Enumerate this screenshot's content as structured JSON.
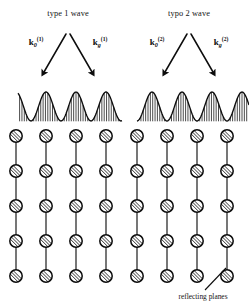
{
  "figure": {
    "name": "bloch-wave-diffraction-diagram",
    "background": "#ffffff",
    "ink_color": "#0d0d0d",
    "width": 249,
    "height": 306
  },
  "panels": [
    {
      "id": "type-1",
      "title": "type 1 wave",
      "title_x": 68,
      "title_y": 16,
      "apex": {
        "x": 68,
        "y": 34
      },
      "vectors": [
        {
          "id": "k0-1",
          "symbol": "k",
          "subscript": "0",
          "superscript": "(1)",
          "label_x": 36,
          "label_y": 45,
          "arrow_from": {
            "x": 66,
            "y": 34
          },
          "arrow_to": {
            "x": 44,
            "y": 72
          }
        },
        {
          "id": "kg-1",
          "symbol": "k",
          "subscript": "g",
          "superscript": "(1)",
          "label_x": 100,
          "label_y": 45,
          "arrow_from": {
            "x": 70,
            "y": 34
          },
          "arrow_to": {
            "x": 92,
            "y": 72
          }
        }
      ],
      "wave": {
        "description": "standing wave with maxima centered on the atom planes",
        "peaks_on_atoms": true,
        "peak_count": 3,
        "peak_positions": [
          46,
          76,
          106
        ],
        "baseline_y": 121,
        "peak_y": 92,
        "x_start": 18,
        "x_end": 122
      }
    },
    {
      "id": "type-2",
      "title": "typo 2 wave",
      "title_x": 189,
      "title_y": 16,
      "apex": {
        "x": 189,
        "y": 34
      },
      "vectors": [
        {
          "id": "k0-2",
          "symbol": "k",
          "subscript": "0",
          "superscript": "(2)",
          "label_x": 157,
          "label_y": 45,
          "arrow_from": {
            "x": 187,
            "y": 34
          },
          "arrow_to": {
            "x": 165,
            "y": 72
          }
        },
        {
          "id": "kg-2",
          "symbol": "k",
          "subscript": "g",
          "superscript": "(2)",
          "label_x": 221,
          "label_y": 45,
          "arrow_from": {
            "x": 191,
            "y": 34
          },
          "arrow_to": {
            "x": 213,
            "y": 72
          }
        }
      ],
      "wave": {
        "description": "standing wave with maxima lying between the atom planes",
        "peaks_on_atoms": false,
        "peak_count": 4,
        "peak_positions": [
          152,
          182,
          212,
          242
        ],
        "baseline_y": 121,
        "peak_y": 92,
        "x_start": 137,
        "x_end": 249
      }
    }
  ],
  "lattice": {
    "columns": 8,
    "rows": 5,
    "column_x": [
      16,
      46,
      76,
      106,
      137,
      167,
      197,
      227
    ],
    "row_y": [
      136,
      171,
      206,
      241,
      276
    ],
    "atom_radius": 6.2,
    "atom_style": "hatched-circle"
  },
  "annotation": {
    "caption": "reflecting planes",
    "caption_x": 203,
    "caption_y": 299,
    "leader_from": {
      "x": 226,
      "y": 268
    },
    "leader_to": {
      "x": 205,
      "y": 290
    }
  }
}
